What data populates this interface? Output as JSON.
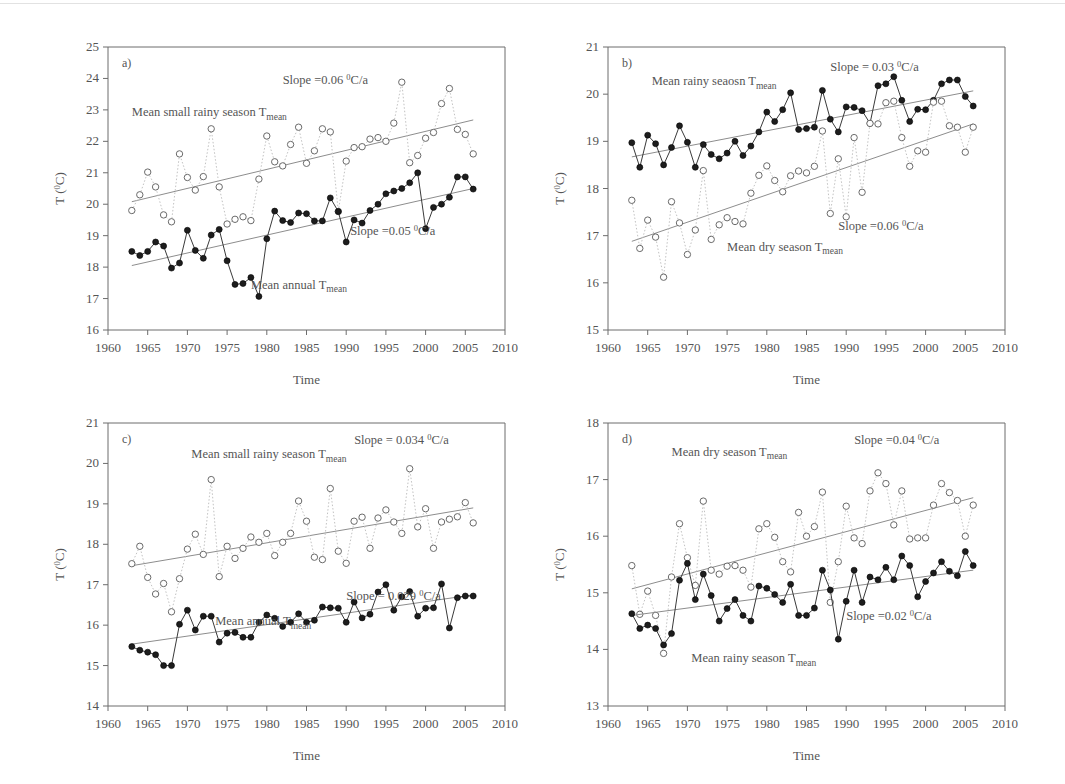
{
  "figure": {
    "type": "multi-panel-line-chart",
    "background": "#ffffff",
    "shared_xlabel": "Time",
    "shared_ylabel": "T (0C)",
    "xlim": [
      1960,
      2010
    ],
    "xticks": [
      1960,
      1965,
      1970,
      1975,
      1980,
      1985,
      1990,
      1995,
      2000,
      2005,
      2010
    ],
    "marker_styles": {
      "filled_circle": "annual / rainy season series",
      "open_circle": "small rainy / dry season series"
    }
  },
  "chart_data": [
    {
      "panel": "a)",
      "type": "line",
      "title": "",
      "xlabel": "Time",
      "ylabel": "T (0C)",
      "xlim": [
        1960,
        2010
      ],
      "ylim": [
        16,
        25
      ],
      "yticks": [
        16,
        17,
        18,
        19,
        20,
        21,
        22,
        23,
        24,
        25
      ],
      "xticks": [
        1960,
        1965,
        1970,
        1975,
        1980,
        1985,
        1990,
        1995,
        2000,
        2005,
        2010
      ],
      "grid": false,
      "legend_position": "inline-annotations",
      "annotations": [
        {
          "text": "Slope =0.06 0C/a",
          "x_frac": 0.44,
          "y_frac": 0.13
        },
        {
          "text": "Mean small rainy season Tmean",
          "x_frac": 0.06,
          "y_frac": 0.245
        },
        {
          "text": "Slope =0.05 0C/a",
          "x_frac": 0.61,
          "y_frac": 0.665
        },
        {
          "text": "Mean annual Tmean",
          "x_frac": 0.36,
          "y_frac": 0.855
        }
      ],
      "x": [
        1963,
        1964,
        1965,
        1966,
        1967,
        1968,
        1969,
        1970,
        1971,
        1972,
        1973,
        1974,
        1975,
        1976,
        1977,
        1978,
        1979,
        1980,
        1981,
        1982,
        1983,
        1984,
        1985,
        1986,
        1987,
        1988,
        1989,
        1990,
        1991,
        1992,
        1993,
        1994,
        1995,
        1996,
        1997,
        1998,
        1999,
        2000,
        2001,
        2002,
        2003,
        2004,
        2005,
        2006
      ],
      "series": [
        {
          "name": "Mean small rainy season Tmean",
          "marker": "open_circle",
          "line": "dotted",
          "values": [
            19.8,
            20.3,
            21.02,
            20.55,
            19.66,
            19.44,
            21.6,
            20.85,
            20.45,
            20.88,
            22.4,
            20.55,
            19.37,
            19.52,
            19.6,
            19.48,
            20.8,
            22.17,
            21.35,
            21.22,
            21.9,
            22.45,
            21.3,
            21.7,
            22.4,
            22.3,
            19.77,
            21.37,
            21.8,
            21.83,
            22.07,
            22.12,
            22.0,
            22.58,
            23.88,
            21.32,
            21.55,
            22.1,
            22.28,
            23.2,
            23.68,
            22.38,
            22.22,
            21.6
          ],
          "trend": {
            "slope": 0.06,
            "label": "Slope =0.06 0C/a",
            "y_start": 20.08,
            "y_end": 22.68
          }
        },
        {
          "name": "Mean annual Tmean",
          "marker": "filled_circle",
          "line": "solid",
          "values": [
            18.5,
            18.37,
            18.5,
            18.8,
            18.67,
            17.97,
            18.13,
            19.17,
            18.53,
            18.28,
            19.02,
            19.2,
            18.2,
            17.45,
            17.48,
            17.67,
            17.07,
            18.9,
            19.78,
            19.48,
            19.42,
            19.72,
            19.7,
            19.47,
            19.47,
            20.2,
            19.77,
            18.8,
            19.5,
            19.4,
            19.8,
            20.0,
            20.33,
            20.42,
            20.5,
            20.68,
            21.0,
            19.22,
            19.9,
            20.0,
            20.22,
            20.87,
            20.87,
            20.48
          ],
          "trend": {
            "slope": 0.05,
            "label": "Slope =0.05 0C/a",
            "y_start": 18.05,
            "y_end": 20.5
          }
        }
      ]
    },
    {
      "panel": "b)",
      "type": "line",
      "title": "",
      "xlabel": "Time",
      "ylabel": "T (0C)",
      "xlim": [
        1960,
        2010
      ],
      "ylim": [
        15,
        21
      ],
      "yticks": [
        15,
        16,
        17,
        18,
        19,
        20,
        21
      ],
      "xticks": [
        1960,
        1965,
        1970,
        1975,
        1980,
        1985,
        1990,
        1995,
        2000,
        2005,
        2010
      ],
      "grid": false,
      "legend_position": "inline-annotations",
      "annotations": [
        {
          "text": "Slope = 0.03 0C/a",
          "x_frac": 0.56,
          "y_frac": 0.085
        },
        {
          "text": "Mean rainy seaosn Tmean",
          "x_frac": 0.11,
          "y_frac": 0.135
        },
        {
          "text": "Slope =0.06 0C/a",
          "x_frac": 0.58,
          "y_frac": 0.645
        },
        {
          "text": "Mean dry season Tmean",
          "x_frac": 0.3,
          "y_frac": 0.72
        }
      ],
      "x": [
        1963,
        1964,
        1965,
        1966,
        1967,
        1968,
        1969,
        1970,
        1971,
        1972,
        1973,
        1974,
        1975,
        1976,
        1977,
        1978,
        1979,
        1980,
        1981,
        1982,
        1983,
        1984,
        1985,
        1986,
        1987,
        1988,
        1989,
        1990,
        1991,
        1992,
        1993,
        1994,
        1995,
        1996,
        1997,
        1998,
        1999,
        2000,
        2001,
        2002,
        2003,
        2004,
        2005,
        2006
      ],
      "series": [
        {
          "name": "Mean rainy seaosn Tmean",
          "marker": "filled_circle",
          "line": "solid",
          "values": [
            18.97,
            18.45,
            19.13,
            18.95,
            18.5,
            18.87,
            19.33,
            18.98,
            18.45,
            18.93,
            18.72,
            18.63,
            18.75,
            19.0,
            18.7,
            18.9,
            19.2,
            19.62,
            19.42,
            19.67,
            20.03,
            19.25,
            19.27,
            19.3,
            20.08,
            19.47,
            19.2,
            19.73,
            19.72,
            19.65,
            19.38,
            20.18,
            20.22,
            20.37,
            19.87,
            19.42,
            19.68,
            19.67,
            19.87,
            20.22,
            20.3,
            20.3,
            19.95,
            19.75
          ],
          "trend": {
            "slope": 0.03,
            "label": "Slope = 0.03 0C/a",
            "y_start": 18.67,
            "y_end": 20.07
          }
        },
        {
          "name": "Mean dry season Tmean",
          "marker": "open_circle",
          "line": "dotted",
          "values": [
            17.75,
            16.73,
            17.33,
            16.97,
            16.12,
            17.72,
            17.27,
            16.6,
            17.12,
            18.38,
            16.92,
            17.23,
            17.38,
            17.3,
            17.25,
            17.9,
            18.28,
            18.48,
            18.17,
            17.93,
            18.27,
            18.37,
            18.33,
            18.47,
            19.22,
            17.47,
            18.63,
            17.4,
            19.08,
            17.92,
            19.38,
            19.37,
            19.82,
            19.85,
            19.08,
            18.47,
            18.8,
            18.77,
            19.83,
            19.85,
            19.33,
            19.3,
            18.77,
            19.3
          ],
          "trend": {
            "slope": 0.06,
            "label": "Slope =0.06 0C/a",
            "y_start": 16.88,
            "y_end": 19.37
          }
        }
      ]
    },
    {
      "panel": "c)",
      "type": "line",
      "title": "",
      "xlabel": "Time",
      "ylabel": "T (0C)",
      "xlim": [
        1960,
        2010
      ],
      "ylim": [
        14,
        21
      ],
      "yticks": [
        14,
        15,
        16,
        17,
        18,
        19,
        20,
        21
      ],
      "xticks": [
        1960,
        1965,
        1970,
        1975,
        1980,
        1985,
        1990,
        1995,
        2000,
        2005,
        2010
      ],
      "grid": false,
      "legend_position": "inline-annotations",
      "annotations": [
        {
          "text": "Slope = 0.034 0C/a",
          "x_frac": 0.62,
          "y_frac": 0.075
        },
        {
          "text": "Mean small rainy season Tmean",
          "x_frac": 0.21,
          "y_frac": 0.125
        },
        {
          "text": "Slope = 0.029 0C/a",
          "x_frac": 0.6,
          "y_frac": 0.625
        },
        {
          "text": "Mean annual Tmean",
          "x_frac": 0.27,
          "y_frac": 0.715
        }
      ],
      "x": [
        1963,
        1964,
        1965,
        1966,
        1967,
        1968,
        1969,
        1970,
        1971,
        1972,
        1973,
        1974,
        1975,
        1976,
        1977,
        1978,
        1979,
        1980,
        1981,
        1982,
        1983,
        1984,
        1985,
        1986,
        1987,
        1988,
        1989,
        1990,
        1991,
        1992,
        1993,
        1994,
        1995,
        1996,
        1997,
        1998,
        1999,
        2000,
        2001,
        2002,
        2003,
        2004,
        2005,
        2006
      ],
      "series": [
        {
          "name": "Mean small rainy season Tmean",
          "marker": "open_circle",
          "line": "dotted",
          "values": [
            17.52,
            17.95,
            17.18,
            16.77,
            17.03,
            16.33,
            17.15,
            17.88,
            18.25,
            17.75,
            19.6,
            17.2,
            17.95,
            17.65,
            17.9,
            18.18,
            18.05,
            18.27,
            17.72,
            18.05,
            18.27,
            19.07,
            18.57,
            17.68,
            17.62,
            19.38,
            17.83,
            17.53,
            18.57,
            18.67,
            17.9,
            18.65,
            18.85,
            18.55,
            18.27,
            19.87,
            18.43,
            18.88,
            17.9,
            18.55,
            18.62,
            18.68,
            19.03,
            18.53
          ],
          "trend": {
            "slope": 0.034,
            "label": "Slope = 0.034 0C/a",
            "y_start": 17.47,
            "y_end": 18.9
          }
        },
        {
          "name": "Mean annual Tmean",
          "marker": "filled_circle",
          "line": "solid",
          "values": [
            15.47,
            15.38,
            15.33,
            15.27,
            15.0,
            15.0,
            16.02,
            16.37,
            15.88,
            16.22,
            16.22,
            15.58,
            15.8,
            15.82,
            15.7,
            15.7,
            16.07,
            16.25,
            16.17,
            15.97,
            16.07,
            16.28,
            16.07,
            16.12,
            16.45,
            16.43,
            16.42,
            16.07,
            16.57,
            16.18,
            16.27,
            16.82,
            17.0,
            16.37,
            16.7,
            16.83,
            16.22,
            16.42,
            16.43,
            17.02,
            15.93,
            16.68,
            16.72,
            16.72
          ],
          "trend": {
            "slope": 0.029,
            "label": "Slope = 0.029 0C/a",
            "y_start": 15.53,
            "y_end": 16.75
          }
        }
      ]
    },
    {
      "panel": "d)",
      "type": "line",
      "title": "",
      "xlabel": "Time",
      "ylabel": "T (0C)",
      "xlim": [
        1960,
        2010
      ],
      "ylim": [
        13,
        18
      ],
      "yticks": [
        13,
        14,
        15,
        16,
        17,
        18
      ],
      "xticks": [
        1960,
        1965,
        1970,
        1975,
        1980,
        1985,
        1990,
        1995,
        2000,
        2005,
        2010
      ],
      "grid": false,
      "legend_position": "inline-annotations",
      "annotations": [
        {
          "text": "Slope =0.04 0C/a",
          "x_frac": 0.62,
          "y_frac": 0.075
        },
        {
          "text": "Mean dry season Tmean",
          "x_frac": 0.16,
          "y_frac": 0.115
        },
        {
          "text": "Slope =0.02 0C/a",
          "x_frac": 0.6,
          "y_frac": 0.695
        },
        {
          "text": "Mean rainy season Tmean",
          "x_frac": 0.21,
          "y_frac": 0.845
        }
      ],
      "x": [
        1963,
        1964,
        1965,
        1966,
        1967,
        1968,
        1969,
        1970,
        1971,
        1972,
        1973,
        1974,
        1975,
        1976,
        1977,
        1978,
        1979,
        1980,
        1981,
        1982,
        1983,
        1984,
        1985,
        1986,
        1987,
        1988,
        1989,
        1990,
        1991,
        1992,
        1993,
        1994,
        1995,
        1996,
        1997,
        1998,
        1999,
        2000,
        2001,
        2002,
        2003,
        2004,
        2005,
        2006
      ],
      "series": [
        {
          "name": "Mean dry season Tmean",
          "marker": "open_circle",
          "line": "dotted",
          "values": [
            15.48,
            14.62,
            15.03,
            14.6,
            13.93,
            15.28,
            16.22,
            15.62,
            15.13,
            16.62,
            15.4,
            15.33,
            15.47,
            15.48,
            15.4,
            15.1,
            16.13,
            16.22,
            15.98,
            15.55,
            15.37,
            16.42,
            16.0,
            16.17,
            16.78,
            14.83,
            15.55,
            16.53,
            15.97,
            15.87,
            16.8,
            17.12,
            16.93,
            16.2,
            16.8,
            15.95,
            15.97,
            15.97,
            16.55,
            16.93,
            16.77,
            16.63,
            16.0,
            16.55
          ],
          "trend": {
            "slope": 0.04,
            "label": "Slope =0.04 0C/a",
            "y_start": 15.07,
            "y_end": 16.68
          }
        },
        {
          "name": "Mean rainy season Tmean",
          "marker": "filled_circle",
          "line": "solid",
          "values": [
            14.63,
            14.37,
            14.43,
            14.37,
            14.08,
            14.28,
            15.22,
            15.52,
            14.88,
            15.33,
            14.95,
            14.5,
            14.72,
            14.88,
            14.6,
            14.5,
            15.12,
            15.08,
            14.97,
            14.83,
            15.15,
            14.6,
            14.6,
            14.73,
            15.4,
            15.05,
            14.18,
            14.85,
            15.4,
            14.83,
            15.28,
            15.23,
            15.45,
            15.23,
            15.65,
            15.48,
            14.93,
            15.2,
            15.35,
            15.55,
            15.38,
            15.3,
            15.73,
            15.48
          ],
          "trend": {
            "slope": 0.02,
            "label": "Slope =0.02 0C/a",
            "y_start": 14.6,
            "y_end": 15.4
          }
        }
      ]
    }
  ]
}
